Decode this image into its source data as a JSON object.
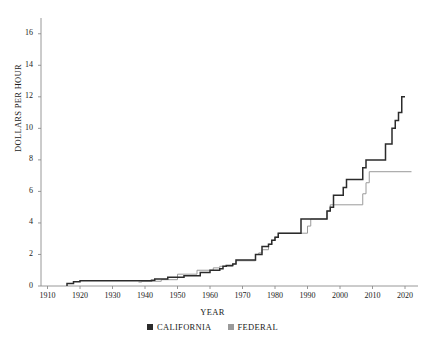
{
  "chart_data": {
    "type": "line",
    "title": "",
    "xlabel": "YEAR",
    "ylabel": "DOLLARS PER HOUR",
    "xlim": [
      1908,
      2024
    ],
    "ylim": [
      0,
      17
    ],
    "xticks": [
      1910,
      1920,
      1930,
      1940,
      1950,
      1960,
      1970,
      1980,
      1990,
      2000,
      2010,
      2020
    ],
    "yticks": [
      0,
      2,
      4,
      6,
      8,
      10,
      12,
      14,
      16
    ],
    "grid": false,
    "legend_position": "bottom-center",
    "series": [
      {
        "name": "CALIFORNIA",
        "color": "#2b2b2b",
        "points": [
          [
            1916,
            0.0
          ],
          [
            1916,
            0.16
          ],
          [
            1918,
            0.16
          ],
          [
            1918,
            0.27
          ],
          [
            1920,
            0.27
          ],
          [
            1920,
            0.33
          ],
          [
            1942,
            0.33
          ],
          [
            1942,
            0.36
          ],
          [
            1943,
            0.36
          ],
          [
            1943,
            0.45
          ],
          [
            1947,
            0.45
          ],
          [
            1947,
            0.55
          ],
          [
            1952,
            0.55
          ],
          [
            1952,
            0.65
          ],
          [
            1957,
            0.65
          ],
          [
            1957,
            0.85
          ],
          [
            1960,
            0.85
          ],
          [
            1960,
            1.0
          ],
          [
            1963,
            1.0
          ],
          [
            1963,
            1.1
          ],
          [
            1964,
            1.1
          ],
          [
            1964,
            1.25
          ],
          [
            1965,
            1.25
          ],
          [
            1965,
            1.3
          ],
          [
            1967,
            1.3
          ],
          [
            1967,
            1.4
          ],
          [
            1968,
            1.4
          ],
          [
            1968,
            1.65
          ],
          [
            1974,
            1.65
          ],
          [
            1974,
            2.0
          ],
          [
            1976,
            2.0
          ],
          [
            1976,
            2.5
          ],
          [
            1978,
            2.5
          ],
          [
            1978,
            2.65
          ],
          [
            1979,
            2.65
          ],
          [
            1979,
            2.9
          ],
          [
            1980,
            2.9
          ],
          [
            1980,
            3.1
          ],
          [
            1981,
            3.1
          ],
          [
            1981,
            3.35
          ],
          [
            1988,
            3.35
          ],
          [
            1988,
            4.25
          ],
          [
            1996,
            4.25
          ],
          [
            1996,
            4.75
          ],
          [
            1997,
            4.75
          ],
          [
            1997,
            5.0
          ],
          [
            1998,
            5.0
          ],
          [
            1998,
            5.75
          ],
          [
            2001,
            5.75
          ],
          [
            2001,
            6.25
          ],
          [
            2002,
            6.25
          ],
          [
            2002,
            6.75
          ],
          [
            2007,
            6.75
          ],
          [
            2007,
            7.5
          ],
          [
            2008,
            7.5
          ],
          [
            2008,
            8.0
          ],
          [
            2014,
            8.0
          ],
          [
            2014,
            9.0
          ],
          [
            2016,
            9.0
          ],
          [
            2016,
            10.0
          ],
          [
            2017,
            10.0
          ],
          [
            2017,
            10.5
          ],
          [
            2018,
            10.5
          ],
          [
            2018,
            11.0
          ],
          [
            2019,
            11.0
          ],
          [
            2019,
            12.0
          ],
          [
            2020,
            12.0
          ]
        ]
      },
      {
        "name": "FEDERAL",
        "color": "#9a9a9a",
        "points": [
          [
            1938,
            0.25
          ],
          [
            1939,
            0.25
          ],
          [
            1939,
            0.3
          ],
          [
            1945,
            0.3
          ],
          [
            1945,
            0.4
          ],
          [
            1950,
            0.4
          ],
          [
            1950,
            0.75
          ],
          [
            1956,
            0.75
          ],
          [
            1956,
            1.0
          ],
          [
            1961,
            1.0
          ],
          [
            1961,
            1.15
          ],
          [
            1963,
            1.15
          ],
          [
            1963,
            1.25
          ],
          [
            1967,
            1.25
          ],
          [
            1967,
            1.4
          ],
          [
            1968,
            1.4
          ],
          [
            1968,
            1.6
          ],
          [
            1974,
            1.6
          ],
          [
            1974,
            2.0
          ],
          [
            1975,
            2.0
          ],
          [
            1975,
            2.1
          ],
          [
            1976,
            2.1
          ],
          [
            1976,
            2.3
          ],
          [
            1978,
            2.3
          ],
          [
            1978,
            2.65
          ],
          [
            1979,
            2.65
          ],
          [
            1979,
            2.9
          ],
          [
            1980,
            2.9
          ],
          [
            1980,
            3.1
          ],
          [
            1981,
            3.1
          ],
          [
            1981,
            3.35
          ],
          [
            1990,
            3.35
          ],
          [
            1990,
            3.8
          ],
          [
            1991,
            3.8
          ],
          [
            1991,
            4.25
          ],
          [
            1996,
            4.25
          ],
          [
            1996,
            4.75
          ],
          [
            1997,
            4.75
          ],
          [
            1997,
            5.15
          ],
          [
            2007,
            5.15
          ],
          [
            2007,
            5.85
          ],
          [
            2008,
            5.85
          ],
          [
            2008,
            6.55
          ],
          [
            2009,
            6.55
          ],
          [
            2009,
            7.25
          ],
          [
            2022,
            7.25
          ]
        ]
      }
    ]
  },
  "axis": {
    "ylabel": "DOLLARS PER HOUR",
    "xlabel": "YEAR",
    "ytick_labels": [
      "16",
      "14",
      "12",
      "10",
      "8",
      "6",
      "4",
      "2",
      "0"
    ],
    "xtick_labels": [
      "1910",
      "1920",
      "1930",
      "1940",
      "1950",
      "1960",
      "1970",
      "1980",
      "1990",
      "2000",
      "2010",
      "2020"
    ]
  },
  "legend": {
    "entries": [
      {
        "label": "CALIFORNIA",
        "color": "#2b2b2b"
      },
      {
        "label": "FEDERAL",
        "color": "#9a9a9a"
      }
    ]
  },
  "colors": {
    "california": "#2b2b2b",
    "federal": "#9a9a9a",
    "axis": "#8c8c8c",
    "text": "#1a1a1a",
    "background": "#ffffff"
  }
}
